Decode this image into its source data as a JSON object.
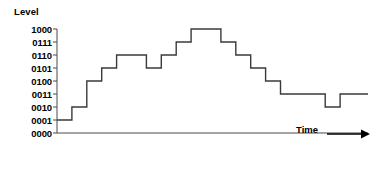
{
  "figure": {
    "axis_title_y": "Level",
    "axis_title_x": "Time",
    "arrow_icon": "right-arrow-icon",
    "line_color": "#3a3a3a",
    "axis_color": "#4a4a4a",
    "background_color": "#ffffff"
  },
  "chart_data": {
    "type": "line",
    "title": "",
    "subtitle": "",
    "xlabel": "Time",
    "ylabel": "Level",
    "grid": false,
    "legend": null,
    "step_style": "post",
    "ytick_labels": [
      "1000",
      "0111",
      "0110",
      "0101",
      "0100",
      "0011",
      "0010",
      "0001",
      "0000"
    ],
    "ytick_values": [
      8,
      7,
      6,
      5,
      4,
      3,
      2,
      1,
      0
    ],
    "ylim": [
      0,
      8
    ],
    "xlim": [
      0,
      20
    ],
    "xtick_labels": [],
    "x": [
      0,
      1,
      2,
      3,
      4,
      5,
      6,
      7,
      8,
      9,
      10,
      11,
      12,
      13,
      14,
      15,
      16,
      17,
      18,
      19,
      20
    ],
    "values": [
      1,
      2,
      4,
      5,
      6,
      6,
      5,
      6,
      7,
      8,
      8,
      7,
      6,
      5,
      4,
      3,
      3,
      3,
      2,
      3,
      3
    ],
    "value_labels": [
      "0001",
      "0010",
      "0100",
      "0101",
      "0110",
      "0110",
      "0101",
      "0110",
      "0111",
      "1000",
      "1000",
      "0111",
      "0110",
      "0101",
      "0100",
      "0011",
      "0011",
      "0011",
      "0010",
      "0011",
      "0011"
    ]
  }
}
